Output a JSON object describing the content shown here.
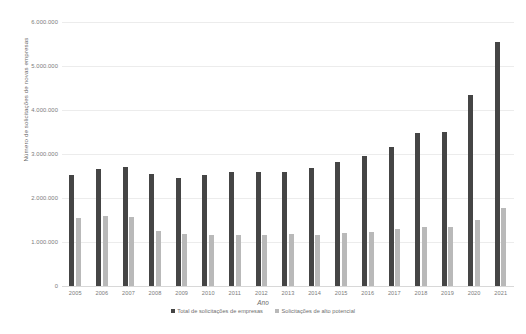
{
  "chart_data": {
    "type": "bar",
    "title": "",
    "xlabel": "Ano",
    "ylabel": "Número de solicitações de novas empresas",
    "categories": [
      "2005",
      "2006",
      "2007",
      "2008",
      "2009",
      "2010",
      "2011",
      "2012",
      "2013",
      "2014",
      "2015",
      "2016",
      "2017",
      "2018",
      "2019",
      "2020",
      "2021"
    ],
    "series": [
      {
        "name": "Total de solicitações de empresas",
        "color": "#454545",
        "values": [
          2520000,
          2660000,
          2700000,
          2540000,
          2450000,
          2530000,
          2600000,
          2580000,
          2600000,
          2680000,
          2820000,
          2950000,
          3150000,
          3480000,
          3500000,
          4340000,
          5550000
        ]
      },
      {
        "name": "Solicitações de alto potencial",
        "color": "#b9b9b9",
        "values": [
          1550000,
          1590000,
          1560000,
          1250000,
          1180000,
          1160000,
          1170000,
          1160000,
          1180000,
          1170000,
          1200000,
          1230000,
          1290000,
          1340000,
          1330000,
          1500000,
          1770000
        ]
      }
    ],
    "ylim": [
      0,
      6000000
    ],
    "yticks": [
      0,
      1000000,
      2000000,
      3000000,
      4000000,
      5000000,
      6000000
    ],
    "ytick_labels": [
      "0",
      "1.000.000",
      "2.000.000",
      "3.000.000",
      "4.000.000",
      "5.000.000",
      "6.000.000"
    ],
    "grid": true,
    "legend_position": "bottom"
  }
}
